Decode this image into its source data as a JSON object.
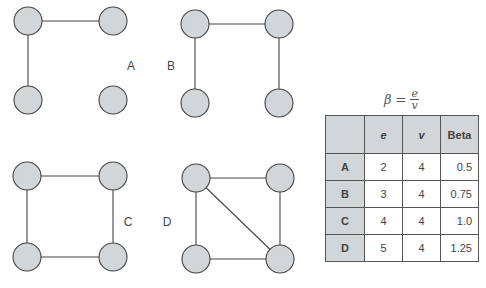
{
  "colors": {
    "node_fill": "#d3d6d9",
    "node_stroke": "#444444",
    "edge": "#444444",
    "table_header_bg": "#d3d6d9",
    "table_border": "#555555"
  },
  "graphs": [
    {
      "label": "A",
      "label_pos": [
        131,
        66
      ],
      "nodes": [
        [
          28,
          21
        ],
        [
          113,
          21
        ],
        [
          28,
          100
        ],
        [
          113,
          100
        ]
      ],
      "edges": [
        [
          0,
          1
        ],
        [
          0,
          2
        ]
      ]
    },
    {
      "label": "B",
      "label_pos": [
        171,
        66
      ],
      "nodes": [
        [
          195,
          24
        ],
        [
          279,
          24
        ],
        [
          195,
          103
        ],
        [
          279,
          103
        ]
      ],
      "edges": [
        [
          0,
          1
        ],
        [
          0,
          2
        ],
        [
          1,
          3
        ]
      ]
    },
    {
      "label": "C",
      "label_pos": [
        128,
        222
      ],
      "nodes": [
        [
          27,
          176
        ],
        [
          113,
          176
        ],
        [
          27,
          257
        ],
        [
          113,
          257
        ]
      ],
      "edges": [
        [
          0,
          1
        ],
        [
          0,
          2
        ],
        [
          1,
          3
        ],
        [
          2,
          3
        ]
      ]
    },
    {
      "label": "D",
      "label_pos": [
        167,
        222
      ],
      "nodes": [
        [
          196,
          178
        ],
        [
          280,
          178
        ],
        [
          196,
          259
        ],
        [
          280,
          259
        ]
      ],
      "edges": [
        [
          0,
          1
        ],
        [
          0,
          2
        ],
        [
          1,
          3
        ],
        [
          2,
          3
        ],
        [
          0,
          3
        ]
      ]
    }
  ],
  "node_radius": 14,
  "formula": {
    "lhs": "β",
    "eq": "=",
    "numerator": "e",
    "denominator": "v"
  },
  "table": {
    "headers": [
      "",
      "e",
      "v",
      "Beta"
    ],
    "rows": [
      {
        "graph": "A",
        "e": "2",
        "v": "4",
        "beta": "0.5"
      },
      {
        "graph": "B",
        "e": "3",
        "v": "4",
        "beta": "0.75"
      },
      {
        "graph": "C",
        "e": "4",
        "v": "4",
        "beta": "1.0"
      },
      {
        "graph": "D",
        "e": "5",
        "v": "4",
        "beta": "1.25"
      }
    ]
  }
}
